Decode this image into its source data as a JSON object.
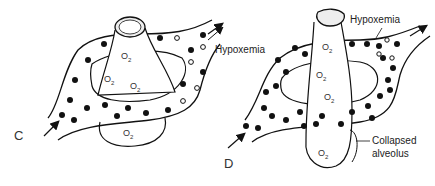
{
  "figure": {
    "panels": [
      {
        "id": "C",
        "label": "C",
        "annotation": "Hypoxemia",
        "o2_labels": [
          "O",
          "O",
          "O",
          "O"
        ],
        "o2_sub": "2",
        "description": "Normal alveolus with capillary ring; blood becomes oxygenated (filled dots) with some unoxygenated (open dots)"
      },
      {
        "id": "D",
        "label": "D",
        "annotation": "Hypoxemia",
        "o2_labels": [
          "O",
          "O",
          "O",
          "O"
        ],
        "o2_sub": "2",
        "callout": "Collapsed\nalveolus",
        "callout_lines": [
          "Collapsed",
          "alveolus"
        ],
        "description": "Collapsed alveolus with capillary ring"
      }
    ],
    "legend": {
      "filled_dot": "oxygenated blood",
      "open_dot": "deoxygenated blood"
    }
  }
}
